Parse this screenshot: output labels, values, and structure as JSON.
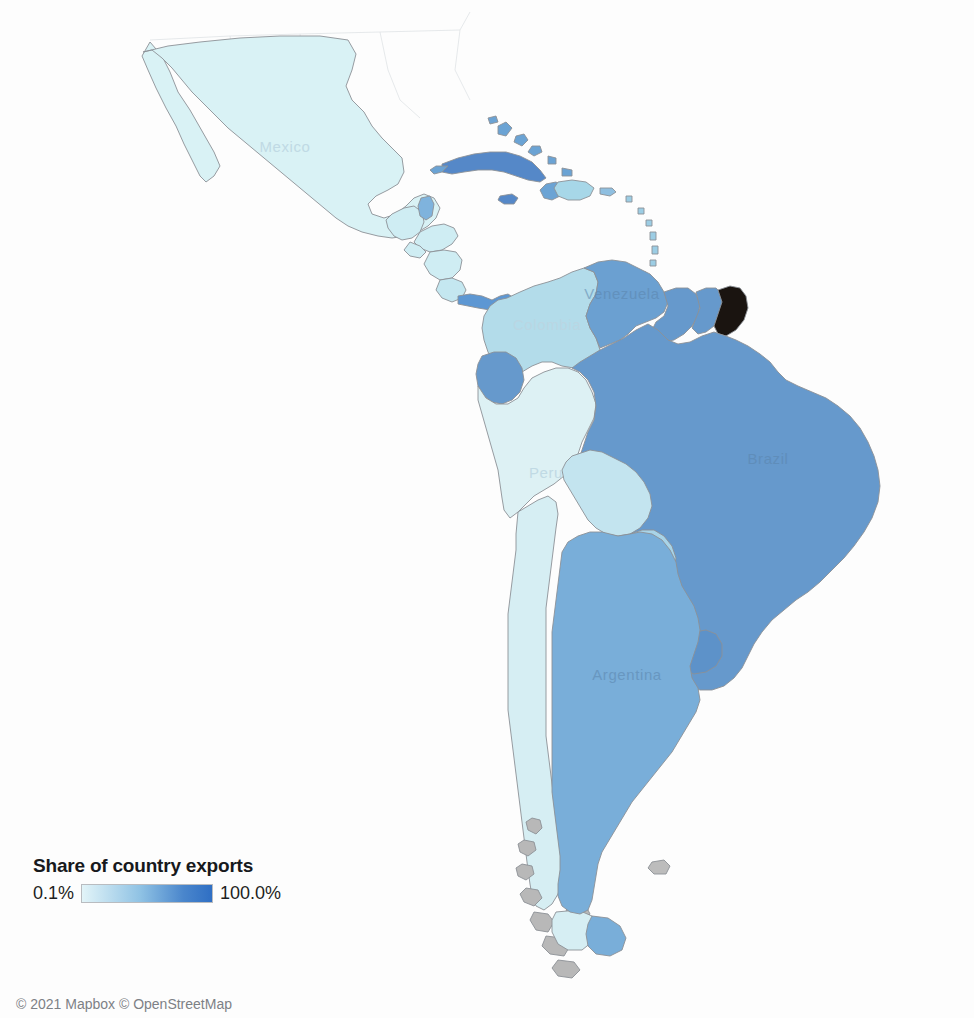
{
  "map": {
    "attribution": "© 2021 Mapbox © OpenStreetMap",
    "background_color": "#fdfdfd",
    "border_color": "#8c9196",
    "labels": [
      {
        "name": "Mexico",
        "text": "Mexico",
        "x": 285,
        "y": 152,
        "tone": "pale"
      },
      {
        "name": "Colombia",
        "text": "Colombia",
        "x": 547,
        "y": 330,
        "tone": "pale"
      },
      {
        "name": "Venezuela",
        "text": "Venezuela",
        "x": 622,
        "y": 299,
        "tone": "dark"
      },
      {
        "name": "Peru",
        "text": "Peru",
        "x": 546,
        "y": 478,
        "tone": "pale"
      },
      {
        "name": "Brazil",
        "text": "Brazil",
        "x": 768,
        "y": 464,
        "tone": "dark"
      },
      {
        "name": "Argentina",
        "text": "Argentina",
        "x": 627,
        "y": 680,
        "tone": "dark"
      }
    ]
  },
  "legend": {
    "title": "Share of country exports",
    "min_label": "0.1%",
    "max_label": "100.0%",
    "gradient_start": "#e2f4f8",
    "gradient_end": "#2f6fc4"
  },
  "chart_data": {
    "type": "choropleth",
    "title": "Share of country exports",
    "value_unit": "percent",
    "scale": {
      "min": 0.1,
      "max": 100.0,
      "min_label": "0.1%",
      "max_label": "100.0%",
      "colors": [
        "#e2f4f8",
        "#2f6fc4"
      ]
    },
    "legend_position": "bottom-left",
    "regions": [
      {
        "name": "Mexico",
        "fill": "#d9f2f5",
        "bin": "very-low"
      },
      {
        "name": "Guatemala",
        "fill": "#cfedf3",
        "bin": "very-low"
      },
      {
        "name": "Belize",
        "fill": "#7fb3dd",
        "bin": "medium"
      },
      {
        "name": "Honduras",
        "fill": "#cfedf3",
        "bin": "very-low"
      },
      {
        "name": "El Salvador",
        "fill": "#cfedf3",
        "bin": "very-low"
      },
      {
        "name": "Nicaragua",
        "fill": "#cfedf3",
        "bin": "very-low"
      },
      {
        "name": "Costa Rica",
        "fill": "#c4e7f0",
        "bin": "very-low"
      },
      {
        "name": "Panama",
        "fill": "#5d97d3",
        "bin": "medium-high"
      },
      {
        "name": "Cuba",
        "fill": "#5588c8",
        "bin": "medium-high"
      },
      {
        "name": "Jamaica",
        "fill": "#5588c8",
        "bin": "medium-high"
      },
      {
        "name": "Haiti",
        "fill": "#6ba3d4",
        "bin": "medium"
      },
      {
        "name": "Dominican Republic",
        "fill": "#a7d7e8",
        "bin": "low"
      },
      {
        "name": "Bahamas",
        "fill": "#6ba3d4",
        "bin": "medium"
      },
      {
        "name": "Puerto Rico",
        "fill": "#8fbfe0",
        "bin": "medium"
      },
      {
        "name": "Colombia",
        "fill": "#b3dcea",
        "bin": "low"
      },
      {
        "name": "Venezuela",
        "fill": "#6ba0d1",
        "bin": "medium"
      },
      {
        "name": "Guyana",
        "fill": "#6699cc",
        "bin": "medium"
      },
      {
        "name": "Suriname",
        "fill": "#6699cc",
        "bin": "medium"
      },
      {
        "name": "French Guiana",
        "fill": "#1a1410",
        "bin": "no-data"
      },
      {
        "name": "Ecuador",
        "fill": "#6699cc",
        "bin": "medium"
      },
      {
        "name": "Peru",
        "fill": "#ddf1f4",
        "bin": "very-low"
      },
      {
        "name": "Brazil",
        "fill": "#6699cc",
        "bin": "medium"
      },
      {
        "name": "Bolivia",
        "fill": "#c3e4ef",
        "bin": "low"
      },
      {
        "name": "Paraguay",
        "fill": "#a8d4e8",
        "bin": "low"
      },
      {
        "name": "Uruguay",
        "fill": "#5d92c9",
        "bin": "medium-high"
      },
      {
        "name": "Chile",
        "fill": "#d6eef3",
        "bin": "very-low"
      },
      {
        "name": "Argentina",
        "fill": "#79aed9",
        "bin": "medium"
      }
    ]
  }
}
